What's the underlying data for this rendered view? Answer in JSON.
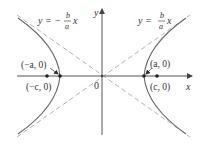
{
  "figure": {
    "type": "hyperbola-diagram",
    "colors": {
      "axes": "#555555",
      "curve": "#666666",
      "asymptote": "#aaaaaa",
      "points": "#222222",
      "text": "#333333"
    },
    "axes": {
      "x_label": "x",
      "y_label": "y",
      "origin_label": "0"
    },
    "asymptotes": [
      {
        "id": "negative",
        "label_prefix": "y = −",
        "frac_num": "b",
        "frac_den": "a",
        "label_suffix": "x"
      },
      {
        "id": "positive",
        "label_prefix": "y = ",
        "frac_num": "b",
        "frac_den": "a",
        "label_suffix": "x"
      }
    ],
    "points": [
      {
        "id": "left-vertex",
        "label": "(−a, 0)"
      },
      {
        "id": "left-focus",
        "label": "(−c, 0)"
      },
      {
        "id": "right-vertex",
        "label": "(a, 0)"
      },
      {
        "id": "right-focus",
        "label": "(c, 0)"
      }
    ]
  }
}
